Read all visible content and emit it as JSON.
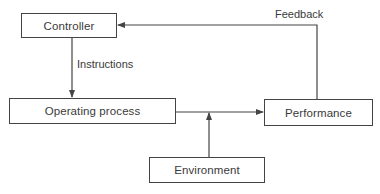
{
  "diagram": {
    "type": "block-diagram",
    "nodes": [
      {
        "id": "controller",
        "label": "Controller"
      },
      {
        "id": "operating_process",
        "label": "Operating process"
      },
      {
        "id": "performance",
        "label": "Performance"
      },
      {
        "id": "environment",
        "label": "Environment"
      }
    ],
    "edges": [
      {
        "from": "controller",
        "to": "operating_process",
        "label": "Instructions"
      },
      {
        "from": "operating_process",
        "to": "performance",
        "label": ""
      },
      {
        "from": "environment",
        "to": "operating_process_performance_link",
        "label": ""
      },
      {
        "from": "performance",
        "to": "controller",
        "label": "Feedback"
      }
    ],
    "colors": {
      "line": "#444444",
      "text": "#3a3a3a",
      "background": "#ffffff"
    }
  },
  "labels": {
    "controller": "Controller",
    "operating_process": "Operating process",
    "performance": "Performance",
    "environment": "Environment",
    "instructions": "Instructions",
    "feedback": "Feedback"
  }
}
